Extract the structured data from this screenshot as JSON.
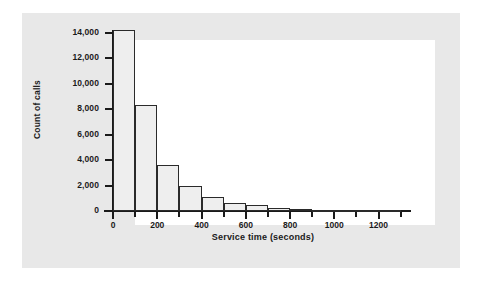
{
  "chart_data": {
    "type": "bar",
    "title": "",
    "subtitle": "",
    "xlabel": "Service time (seconds)",
    "ylabel": "Count of calls",
    "xlim": [
      -100,
      1350
    ],
    "ylim": [
      0,
      14600
    ],
    "grid": false,
    "legend": null,
    "bin_width": 100,
    "categories": [
      "0–100",
      "100–200",
      "200–300",
      "300–400",
      "400–500",
      "500–600",
      "600–700",
      "700–800",
      "800–900",
      "900–1000",
      "1000–1100",
      "1100–1200",
      "1200–1300"
    ],
    "bin_starts": [
      0,
      100,
      200,
      300,
      400,
      500,
      600,
      700,
      800,
      900,
      1000,
      1100,
      1200
    ],
    "values": [
      14200,
      8300,
      3600,
      2000,
      1100,
      650,
      470,
      250,
      190,
      110,
      60,
      30,
      15
    ],
    "xticks": [
      0,
      200,
      400,
      600,
      800,
      1000,
      1200
    ],
    "xtick_labels": [
      "0",
      "200",
      "400",
      "600",
      "800",
      "1000",
      "1200"
    ],
    "xticks_minor": [
      100,
      300,
      500,
      700,
      900,
      1100,
      1300
    ],
    "yticks": [
      0,
      2000,
      4000,
      6000,
      8000,
      10000,
      12000,
      14000
    ],
    "ytick_labels": [
      "0",
      "2,000",
      "4,000",
      "6,000",
      "8,000",
      "10,000",
      "12,000",
      "14,000"
    ],
    "colors": {
      "bar_fill": "#eeeeee",
      "bar_edge": "#2a2a2a",
      "axis": "#1a1a1a",
      "plot_background": "#ffffff",
      "panel_background": "#e8e8e8",
      "figure_background": "#ffffff",
      "text": "#1a1a1a"
    }
  }
}
